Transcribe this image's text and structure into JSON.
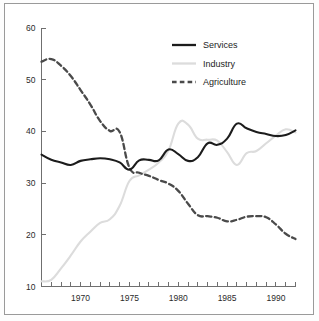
{
  "chart_data": {
    "type": "line",
    "title": "",
    "subtitle": "",
    "xlabel": "",
    "ylabel": "",
    "xlim": [
      1966,
      1992
    ],
    "ylim": [
      10,
      60
    ],
    "grid": false,
    "legend_position": "top-center",
    "y_ticks": [
      10,
      20,
      30,
      40,
      50,
      60
    ],
    "y_tick_labels": [
      "10",
      "20",
      "30",
      "40",
      "50",
      "60"
    ],
    "x_ticks": [
      1966,
      1967,
      1968,
      1969,
      1970,
      1971,
      1972,
      1973,
      1974,
      1975,
      1976,
      1977,
      1978,
      1979,
      1980,
      1981,
      1982,
      1983,
      1984,
      1985,
      1986,
      1987,
      1988,
      1989,
      1990,
      1991,
      1992
    ],
    "x_tick_labels": [
      {
        "value": 1970,
        "label": "1970"
      },
      {
        "value": 1975,
        "label": "1975"
      },
      {
        "value": 1980,
        "label": "1980"
      },
      {
        "value": 1985,
        "label": "1985"
      },
      {
        "value": 1990,
        "label": "1990"
      }
    ],
    "x": [
      1966,
      1967,
      1968,
      1969,
      1970,
      1971,
      1972,
      1973,
      1974,
      1975,
      1976,
      1977,
      1978,
      1979,
      1980,
      1981,
      1982,
      1983,
      1984,
      1985,
      1986,
      1987,
      1988,
      1989,
      1990,
      1991,
      1992
    ],
    "series": [
      {
        "name": "Services",
        "color": "#1c1c1c",
        "style": "solid",
        "width": 2.1,
        "values": [
          35.5,
          34.5,
          34.0,
          33.5,
          34.3,
          34.6,
          34.8,
          34.6,
          34.0,
          32.6,
          34.4,
          34.5,
          34.4,
          36.5,
          35.6,
          34.3,
          35.0,
          37.7,
          37.4,
          38.6,
          41.5,
          40.6,
          39.9,
          39.5,
          39.1,
          39.3,
          40.2
        ]
      },
      {
        "name": "Industry",
        "color": "#dcdcdc",
        "style": "solid",
        "width": 2.1,
        "values": [
          11.0,
          11.3,
          13.5,
          16.0,
          18.7,
          20.6,
          22.3,
          23.0,
          25.6,
          30.4,
          31.5,
          32.6,
          34.0,
          36.3,
          41.5,
          41.3,
          38.6,
          38.4,
          38.2,
          36.0,
          33.5,
          35.8,
          36.2,
          37.7,
          39.2,
          40.4,
          39.8
        ]
      },
      {
        "name": "Agriculture",
        "color": "#4a4a4a",
        "style": "dashed",
        "width": 2.3,
        "values": [
          53.5,
          54.0,
          52.7,
          50.7,
          48.0,
          45.2,
          42.0,
          40.1,
          39.9,
          33.0,
          32.0,
          31.4,
          30.6,
          29.9,
          28.5,
          26.0,
          23.8,
          23.6,
          23.3,
          22.6,
          22.9,
          23.5,
          23.6,
          23.4,
          22.0,
          20.2,
          19.2
        ]
      }
    ],
    "legend": [
      {
        "label": "Services",
        "color": "#1c1c1c",
        "style": "solid"
      },
      {
        "label": "Industry",
        "color": "#dcdcdc",
        "style": "solid"
      },
      {
        "label": "Agriculture",
        "color": "#4a4a4a",
        "style": "dashed"
      }
    ]
  }
}
